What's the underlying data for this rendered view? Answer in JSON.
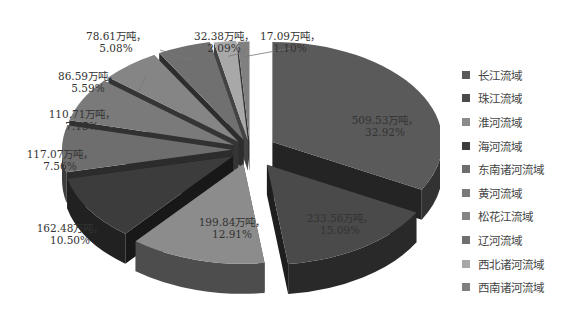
{
  "chart_data": {
    "type": "pie",
    "variant": "3d-exploded",
    "title": "",
    "unit": "万吨",
    "start": "12 o'clock, clockwise",
    "legend_position": "right",
    "slices": [
      {
        "name": "长江流域",
        "value": 509.53,
        "percent": 32.92,
        "label": "509.53万吨，",
        "pct_label": "32.92%",
        "color": "#5a5a5a"
      },
      {
        "name": "珠江流域",
        "value": 233.56,
        "percent": 15.09,
        "label": "233.56万吨，",
        "pct_label": "15.09%",
        "color": "#4a4a4a"
      },
      {
        "name": "淮河流域",
        "value": 199.84,
        "percent": 12.91,
        "label": "199.84万吨，",
        "pct_label": "12.91%",
        "color": "#8c8c8c"
      },
      {
        "name": "海河流域",
        "value": 162.48,
        "percent": 10.5,
        "label": "162.48万吨，",
        "pct_label": "10.50%",
        "color": "#3c3c3c"
      },
      {
        "name": "东南诸河流域",
        "value": 117.07,
        "percent": 7.56,
        "label": "117.07万吨，",
        "pct_label": "7.56%",
        "color": "#6e6e6e"
      },
      {
        "name": "黄河流域",
        "value": 110.71,
        "percent": 7.15,
        "label": "110.71万吨，",
        "pct_label": "7.15%",
        "color": "#7a7a7a"
      },
      {
        "name": "松花江流域",
        "value": 86.59,
        "percent": 5.59,
        "label": "86.59万吨，",
        "pct_label": "5.59%",
        "color": "#858585"
      },
      {
        "name": "辽河流域",
        "value": 78.61,
        "percent": 5.08,
        "label": "78.61万吨，",
        "pct_label": "5.08%",
        "color": "#707070"
      },
      {
        "name": "西北诸河流域",
        "value": 32.38,
        "percent": 2.09,
        "label": "32.38万吨，",
        "pct_label": "2.09%",
        "color": "#a8a8a8"
      },
      {
        "name": "西南诸河流域",
        "value": 17.09,
        "percent": 1.1,
        "label": "17.09万吨，",
        "pct_label": "1.10%",
        "color": "#808080"
      }
    ]
  }
}
